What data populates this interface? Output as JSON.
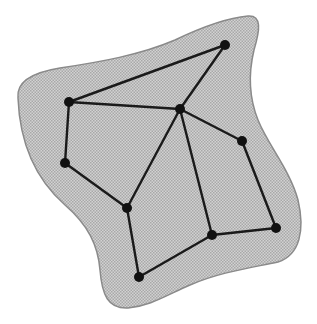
{
  "diagram": {
    "title": "Planar graph embedded in a shaded region",
    "colors": {
      "background": "#ffffff",
      "region_fill": "#c4c4c4",
      "region_stroke": "#8a8a8a",
      "edge": "#1a1a1a",
      "node": "#111111"
    },
    "region": {
      "path": "M 18 98 C 16 80, 35 72, 60 68 C 100 62, 140 55, 175 40 C 200 28, 225 18, 248 16 C 262 15, 260 30, 254 50 C 248 75, 250 100, 258 120 C 268 145, 290 170, 298 200 C 305 230, 300 255, 278 262 C 250 268, 220 272, 190 285 C 165 296, 150 306, 128 308 C 108 309, 102 295, 100 270 C 98 245, 88 225, 65 205 C 40 183, 20 150, 18 98 Z"
    },
    "nodes": [
      {
        "id": "A",
        "x": 225,
        "y": 45
      },
      {
        "id": "B",
        "x": 69,
        "y": 102
      },
      {
        "id": "C",
        "x": 180,
        "y": 109
      },
      {
        "id": "D",
        "x": 242,
        "y": 141
      },
      {
        "id": "E",
        "x": 65,
        "y": 163
      },
      {
        "id": "F",
        "x": 127,
        "y": 208
      },
      {
        "id": "G",
        "x": 212,
        "y": 235
      },
      {
        "id": "H",
        "x": 276,
        "y": 228
      },
      {
        "id": "I",
        "x": 139,
        "y": 277
      }
    ],
    "edges": [
      [
        "A",
        "B"
      ],
      [
        "A",
        "C"
      ],
      [
        "B",
        "C"
      ],
      [
        "B",
        "E"
      ],
      [
        "E",
        "F"
      ],
      [
        "F",
        "C"
      ],
      [
        "C",
        "D"
      ],
      [
        "C",
        "G"
      ],
      [
        "D",
        "H"
      ],
      [
        "G",
        "H"
      ],
      [
        "F",
        "I"
      ],
      [
        "I",
        "G"
      ]
    ],
    "node_radius": 5,
    "edge_width": 2.4
  }
}
